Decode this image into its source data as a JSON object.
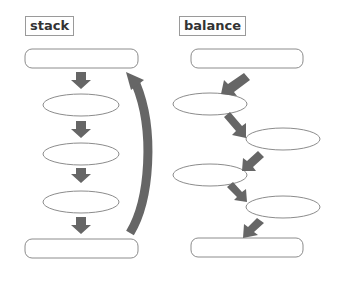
{
  "diagrams": [
    {
      "label": "stack",
      "description": "vertical chain of nodes with straight down arrows and a curved return arrow"
    },
    {
      "label": "balance",
      "description": "zig-zag chain of nodes alternating left and right with diagonal arrows"
    }
  ],
  "colors": {
    "arrow": "#666666",
    "stroke": "#8c8c8c",
    "fill": "#ffffff",
    "text": "#333333"
  }
}
